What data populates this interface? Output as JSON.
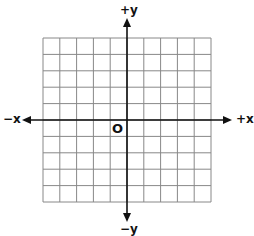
{
  "diagram": {
    "type": "coordinate-plane",
    "labels": {
      "pos_y": "+y",
      "neg_y": "−y",
      "pos_x": "+x",
      "neg_x": "−x",
      "origin": "O"
    },
    "grid": {
      "columns": 10,
      "rows": 10,
      "line_color": "#888888",
      "axis_color": "#111111"
    }
  }
}
